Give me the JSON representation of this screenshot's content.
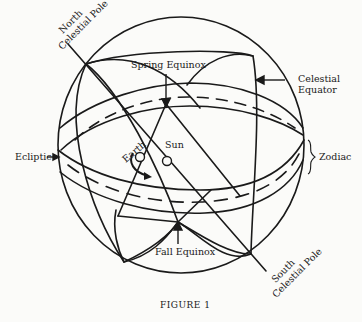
{
  "figure": {
    "caption": "FIGURE 1",
    "type": "celestial-sphere-diagram"
  },
  "labels": {
    "north_pole_line1": "North",
    "north_pole_line2": "Celestial Pole",
    "south_pole_line1": "South",
    "south_pole_line2": "Celestial Pole",
    "spring_equinox": "Spring Equinox",
    "fall_equinox": "Fall Equinox",
    "celestial_equator_line1": "Celestial",
    "celestial_equator_line2": "Equator",
    "ecliptic": "Ecliptic",
    "zodiac": "Zodiac",
    "earth": "Earth",
    "sun": "Sun"
  },
  "colors": {
    "ink": "#1a1a1a",
    "paper": "#fbfbf9"
  }
}
